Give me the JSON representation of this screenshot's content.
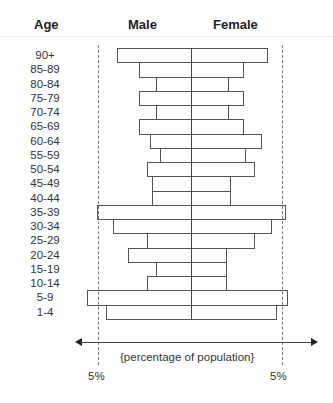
{
  "header": {
    "age": "Age",
    "male": "Male",
    "female": "Female"
  },
  "axis": {
    "label": "{percentage of population}",
    "left_tick": "5%",
    "right_tick": "5%"
  },
  "chart_data": {
    "type": "bar",
    "subtype": "population-pyramid",
    "title": "",
    "xlabel": "{percentage of population}",
    "ylabel": "Age",
    "categories": [
      "90+",
      "85-89",
      "80-84",
      "75-79",
      "70-74",
      "65-69",
      "60-64",
      "55-59",
      "50-54",
      "45-49",
      "40-44",
      "35-39",
      "30-34",
      "25-29",
      "20-24",
      "15-19",
      "10-14",
      "5-9",
      "1-4"
    ],
    "series": [
      {
        "name": "Male",
        "values": [
          4.0,
          2.8,
          1.9,
          2.8,
          1.9,
          2.8,
          2.2,
          1.7,
          2.4,
          2.1,
          2.1,
          5.1,
          4.2,
          2.4,
          3.4,
          1.9,
          2.4,
          5.6,
          4.6
        ]
      },
      {
        "name": "Female",
        "values": [
          4.1,
          2.8,
          2.0,
          2.8,
          2.0,
          2.8,
          3.8,
          2.9,
          3.4,
          2.1,
          2.1,
          5.1,
          4.3,
          3.4,
          1.9,
          1.9,
          1.9,
          5.2,
          4.6
        ]
      }
    ],
    "reference_lines": [
      {
        "value": 5,
        "side": "Male",
        "label": "5%"
      },
      {
        "value": 5,
        "side": "Female",
        "label": "5%"
      }
    ],
    "xlim": [
      -6,
      6
    ],
    "grid": false,
    "legend": "header labels above bars (Male left, Female right)"
  }
}
